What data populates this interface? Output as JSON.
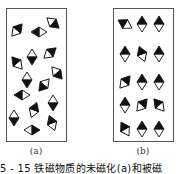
{
  "panels": [
    {
      "id": "a",
      "label": "(a)",
      "description": "unmagnetized - randomly oriented domains",
      "frame": {
        "x": 6,
        "y": 8,
        "w": 60,
        "h": 133
      },
      "domains": [
        {
          "x": 17,
          "y": 30,
          "angle": 40
        },
        {
          "x": 39,
          "y": 32,
          "angle": -90
        },
        {
          "x": 53,
          "y": 23,
          "angle": 130
        },
        {
          "x": 32,
          "y": 57,
          "angle": 180
        },
        {
          "x": 50,
          "y": 53,
          "angle": 50
        },
        {
          "x": 17,
          "y": 63,
          "angle": -40
        },
        {
          "x": 57,
          "y": 73,
          "angle": 140
        },
        {
          "x": 27,
          "y": 80,
          "angle": 180
        },
        {
          "x": 44,
          "y": 85,
          "angle": -140
        },
        {
          "x": 22,
          "y": 95,
          "angle": -90
        },
        {
          "x": 53,
          "y": 103,
          "angle": 180
        },
        {
          "x": 34,
          "y": 110,
          "angle": 20
        },
        {
          "x": 14,
          "y": 118,
          "angle": 180
        },
        {
          "x": 32,
          "y": 130,
          "angle": 90
        },
        {
          "x": 52,
          "y": 123,
          "angle": -20
        }
      ]
    },
    {
      "id": "b",
      "label": "(b)",
      "description": "magnetized - aligned domains",
      "frame": {
        "x": 113,
        "y": 8,
        "w": 60,
        "h": 133
      },
      "domains": [
        {
          "x": 125,
          "y": 24,
          "angle": -60
        },
        {
          "x": 142,
          "y": 24,
          "angle": 0
        },
        {
          "x": 159,
          "y": 24,
          "angle": 0
        },
        {
          "x": 125,
          "y": 54,
          "angle": 0
        },
        {
          "x": 142,
          "y": 54,
          "angle": -20
        },
        {
          "x": 159,
          "y": 54,
          "angle": 0
        },
        {
          "x": 125,
          "y": 82,
          "angle": 40
        },
        {
          "x": 142,
          "y": 82,
          "angle": 0
        },
        {
          "x": 159,
          "y": 82,
          "angle": 0
        },
        {
          "x": 125,
          "y": 105,
          "angle": 0
        },
        {
          "x": 142,
          "y": 105,
          "angle": 40
        },
        {
          "x": 159,
          "y": 105,
          "angle": -40
        },
        {
          "x": 125,
          "y": 129,
          "angle": -30
        },
        {
          "x": 142,
          "y": 129,
          "angle": 0
        },
        {
          "x": 159,
          "y": 129,
          "angle": 0
        }
      ]
    }
  ],
  "caption": "5 - 15   铁磁物质的未磁化(a)和被磁",
  "colors": {
    "frame": "#555555",
    "fill_dark": "#111111",
    "fill_light": "#ffffff"
  }
}
